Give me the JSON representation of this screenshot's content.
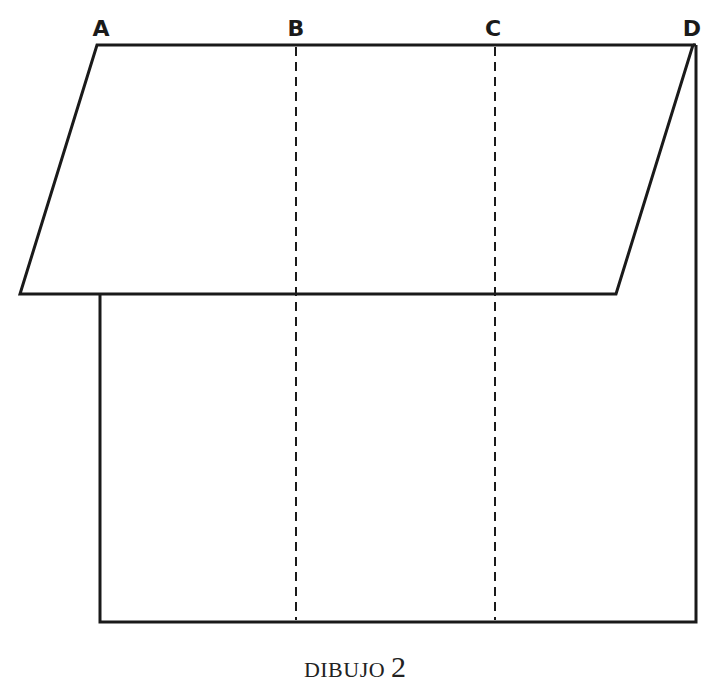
{
  "diagram": {
    "caption_word": "DIBUJO",
    "caption_number": "2",
    "labels": {
      "a": "A",
      "b": "B",
      "c": "C",
      "d": "D"
    },
    "stroke_color": "#1a1a1a",
    "background": "#ffffff",
    "shapes": {
      "parallelogram": [
        [
          97,
          45
        ],
        [
          693,
          45
        ],
        [
          616,
          294
        ],
        [
          20,
          294
        ]
      ],
      "rectangle": {
        "left": 100,
        "top": 45,
        "right": 696,
        "bottom": 622
      },
      "fold_lines": [
        {
          "label": "B",
          "x": 296,
          "y1": 45,
          "y2": 622,
          "style": "dashed"
        },
        {
          "label": "C",
          "x": 495,
          "y1": 45,
          "y2": 622,
          "style": "dashed"
        }
      ]
    }
  }
}
